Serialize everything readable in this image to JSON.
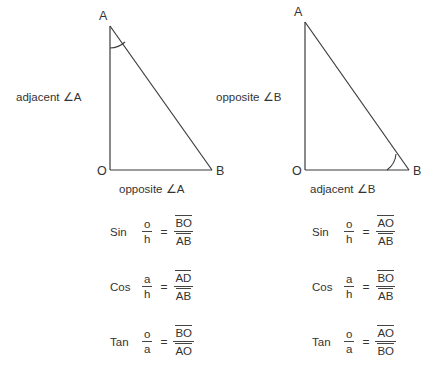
{
  "diagram": {
    "stroke_color": "#3b3b3b",
    "text_color": "#333333",
    "background": "#ffffff"
  },
  "triangles": [
    {
      "id": "left-triangle",
      "vertices": {
        "apex": "A",
        "right_angle": "O",
        "base_right": "B"
      },
      "marked_angle_at": "A",
      "left_side_label": "adjacent ∠A",
      "bottom_side_label": "opposite ∠A"
    },
    {
      "id": "right-triangle",
      "vertices": {
        "apex": "A",
        "right_angle": "O",
        "base_right": "B"
      },
      "marked_angle_at": "B",
      "left_side_label": "opposite ∠B",
      "bottom_side_label": "adjacent ∠B"
    }
  ],
  "formulas": {
    "left": [
      {
        "name": "Sin",
        "ratio_num": "o",
        "ratio_den": "h",
        "equals": "=",
        "result_num": "BO",
        "result_den": "AB"
      },
      {
        "name": "Cos",
        "ratio_num": "a",
        "ratio_den": "h",
        "equals": "=",
        "result_num": "AD",
        "result_den": "AB"
      },
      {
        "name": "Tan",
        "ratio_num": "o",
        "ratio_den": "a",
        "equals": "=",
        "result_num": "BO",
        "result_den": "AO"
      }
    ],
    "right": [
      {
        "name": "Sin",
        "ratio_num": "o",
        "ratio_den": "h",
        "equals": "=",
        "result_num": "AO",
        "result_den": "AB"
      },
      {
        "name": "Cos",
        "ratio_num": "a",
        "ratio_den": "h",
        "equals": "=",
        "result_num": "BO",
        "result_den": "AB"
      },
      {
        "name": "Tan",
        "ratio_num": "o",
        "ratio_den": "a",
        "equals": "=",
        "result_num": "AO",
        "result_den": "BO"
      }
    ]
  }
}
